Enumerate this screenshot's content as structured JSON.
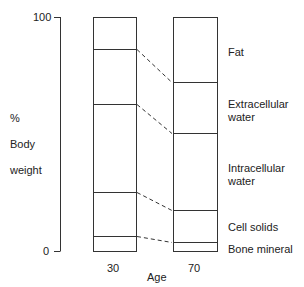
{
  "chart_data": {
    "type": "bar",
    "subtype": "stacked-100-percent",
    "title": "",
    "xlabel": "Age",
    "ylabel": "% Body weight",
    "ylim": [
      0,
      100
    ],
    "y_ticks": [
      "0",
      "100"
    ],
    "categories": [
      "30",
      "70"
    ],
    "series": [
      {
        "name": "Bone mineral",
        "values": [
          6.4,
          3.8
        ]
      },
      {
        "name": "Cell solids",
        "values": [
          18.8,
          13.7
        ]
      },
      {
        "name": "Intracellular water",
        "values": [
          37.6,
          32.9
        ]
      },
      {
        "name": "Extracellular water",
        "values": [
          23.5,
          21.8
        ]
      },
      {
        "name": "Fat",
        "values": [
          13.7,
          27.8
        ]
      }
    ],
    "grid": false,
    "legend_position": "right (inline labels beside age-70 bar)",
    "connectors": "dashed lines link matching segment boundaries between bars"
  },
  "axis": {
    "y_label_line1": "%",
    "y_label_line2": "Body",
    "y_label_line3": "weight",
    "y_top_tick": "100",
    "y_bottom_tick": "0",
    "x_label": "Age",
    "x_tick_1": "30",
    "x_tick_2": "70"
  },
  "labels": {
    "fat": "Fat",
    "ecw": "Extracellular\nwater",
    "icw": "Intracellular\nwater",
    "cell_solids": "Cell solids",
    "bone_mineral": "Bone mineral"
  },
  "colors": {
    "line": "#333333",
    "background": "#ffffff"
  }
}
